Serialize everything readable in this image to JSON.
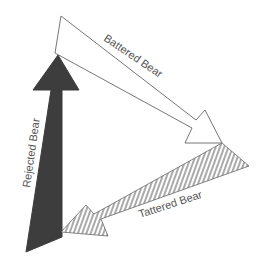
{
  "diagram": {
    "arrows": [
      {
        "id": "battered",
        "label": "Battered Bear",
        "style": "white outline",
        "fill": "#ffffff",
        "stroke": "#666666"
      },
      {
        "id": "rejected",
        "label": "Rejected Bear",
        "style": "solid dark",
        "fill": "#3d3d3d",
        "stroke": "#3d3d3d"
      },
      {
        "id": "tattered",
        "label": "Tattered Bear",
        "style": "hatched",
        "fill": "hatch",
        "stroke": "#666666"
      }
    ]
  }
}
